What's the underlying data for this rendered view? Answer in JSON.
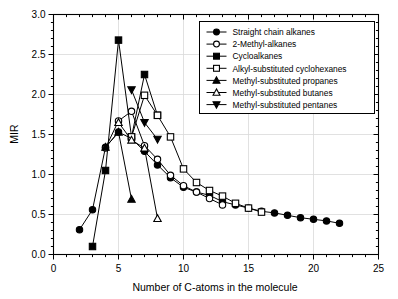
{
  "chart_data": {
    "type": "line",
    "title": "",
    "xlabel": "Number of C-atoms in the molecule",
    "ylabel": "MIR",
    "xlim": [
      0,
      25
    ],
    "ylim": [
      0,
      3.0
    ],
    "xticks": [
      "0",
      "5",
      "10",
      "15",
      "20",
      "25"
    ],
    "yticks": [
      "0.0",
      "0.5",
      "1.0",
      "1.5",
      "2.0",
      "2.5",
      "3.0"
    ],
    "xtick_values": [
      0,
      5,
      10,
      15,
      20,
      25
    ],
    "ytick_values": [
      0.0,
      0.5,
      1.0,
      1.5,
      2.0,
      2.5,
      3.0
    ],
    "grid": "horizontal-and-vertical-light",
    "legend_position": "top-right-inside",
    "series": [
      {
        "name": "Straight chain alkanes",
        "marker": "filled-circle",
        "color": "#000000",
        "x": [
          2,
          3,
          4,
          5,
          6,
          7,
          8,
          9,
          10,
          11,
          12,
          13,
          14,
          15,
          16,
          17,
          18,
          19,
          20,
          21,
          22
        ],
        "values": [
          0.31,
          0.56,
          1.34,
          1.53,
          1.45,
          1.29,
          1.12,
          0.96,
          0.84,
          0.78,
          0.74,
          0.66,
          0.62,
          0.58,
          0.54,
          0.52,
          0.49,
          0.46,
          0.44,
          0.42,
          0.39
        ]
      },
      {
        "name": "2-Methyl-alkanes",
        "marker": "open-circle",
        "color": "#000000",
        "x": [
          4,
          5,
          6,
          7,
          8,
          9,
          10,
          11,
          12,
          13
        ],
        "values": [
          1.33,
          1.67,
          1.79,
          1.36,
          1.19,
          0.99,
          0.86,
          0.78,
          0.7,
          0.62
        ]
      },
      {
        "name": "Cycloalkanes",
        "marker": "filled-square",
        "color": "#000000",
        "x": [
          3,
          4,
          5,
          6,
          7,
          8
        ],
        "values": [
          0.1,
          1.05,
          2.68,
          1.47,
          2.25,
          1.74
        ]
      },
      {
        "name": "Alkyl-substituted cyclohexanes",
        "marker": "open-square",
        "color": "#000000",
        "x": [
          6,
          7,
          8,
          9,
          10,
          11,
          12,
          13,
          14,
          15,
          16
        ],
        "values": [
          1.47,
          1.99,
          1.74,
          1.47,
          1.07,
          0.9,
          0.8,
          0.73,
          0.64,
          0.58,
          0.53
        ]
      },
      {
        "name": "Methyl-substituted propanes",
        "marker": "filled-triangle-up",
        "color": "#000000",
        "x": [
          4,
          5,
          6
        ],
        "values": [
          1.34,
          1.53,
          0.69
        ]
      },
      {
        "name": "Methyl-substituted butanes",
        "marker": "open-triangle-up",
        "color": "#000000",
        "x": [
          5,
          6,
          7,
          8
        ],
        "values": [
          1.65,
          1.43,
          1.33,
          0.45
        ]
      },
      {
        "name": "Methyl-substituted pentanes",
        "marker": "filled-triangle-down",
        "color": "#000000",
        "x": [
          6,
          7,
          8
        ],
        "values": [
          2.06,
          1.65,
          1.44
        ]
      }
    ]
  }
}
